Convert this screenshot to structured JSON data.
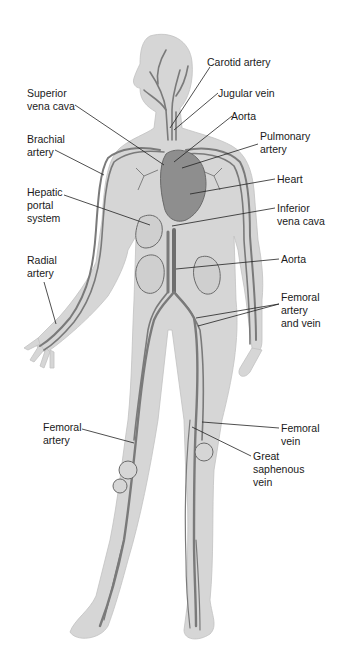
{
  "figure": {
    "colors": {
      "body": "#d4d4d4",
      "vessel": "#7a7a7a",
      "vessel_dark": "#5a5a5a",
      "heart": "#8c8c8c",
      "leader": "#222222",
      "text": "#1a1a1a"
    }
  },
  "labels": [
    {
      "id": "carotid-artery",
      "text": "Carotid artery",
      "x": 207,
      "y": 56
    },
    {
      "id": "superior-vena-cava",
      "text": "Superior\nvena cava",
      "x": 27,
      "y": 87
    },
    {
      "id": "jugular-vein",
      "text": "Jugular vein",
      "x": 218,
      "y": 87
    },
    {
      "id": "aorta-upper",
      "text": "Aorta",
      "x": 231,
      "y": 110
    },
    {
      "id": "brachial-artery",
      "text": "Brachial\nartery",
      "x": 27,
      "y": 133
    },
    {
      "id": "pulmonary-artery",
      "text": "Pulmonary\nartery",
      "x": 260,
      "y": 130
    },
    {
      "id": "heart",
      "text": "Heart",
      "x": 277,
      "y": 173
    },
    {
      "id": "hepatic-portal-system",
      "text": "Hepatic\nportal\nsystem",
      "x": 27,
      "y": 186
    },
    {
      "id": "inferior-vena-cava",
      "text": "Inferior\nvena cava",
      "x": 277,
      "y": 202
    },
    {
      "id": "aorta-lower",
      "text": "Aorta",
      "x": 281,
      "y": 253
    },
    {
      "id": "radial-artery",
      "text": "Radial\nartery",
      "x": 27,
      "y": 254
    },
    {
      "id": "femoral-artery-and-vein",
      "text": "Femoral\nartery\nand vein",
      "x": 281,
      "y": 291
    },
    {
      "id": "femoral-artery",
      "text": "Femoral\nartery",
      "x": 43,
      "y": 421
    },
    {
      "id": "femoral-vein",
      "text": "Femoral\nvein",
      "x": 281,
      "y": 422
    },
    {
      "id": "great-saphenous-vein",
      "text": "Great\nsaphenous\nvein",
      "x": 253,
      "y": 450
    }
  ]
}
